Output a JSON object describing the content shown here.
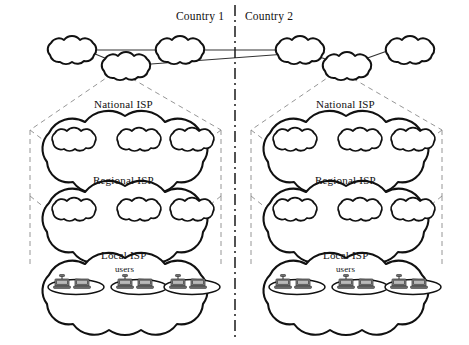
{
  "diagram": {
    "type": "network-topology",
    "countries": [
      {
        "id": "country-1",
        "label": "Country 1"
      },
      {
        "id": "country-2",
        "label": "Country 2"
      }
    ],
    "border": {
      "name": "country-border",
      "style": "dash-dot",
      "x": 235
    },
    "tiers": [
      {
        "id": "backbone",
        "label": "",
        "cloud_count": 3
      },
      {
        "id": "national",
        "label": "National ISP",
        "inner_cloud_count": 3
      },
      {
        "id": "regional",
        "label": "Regional ISP",
        "inner_cloud_count": 3
      },
      {
        "id": "local",
        "label": "Local ISP",
        "inner_cloud_count": 3,
        "users_label": "users",
        "users_per_lan": 2
      }
    ],
    "labels": {
      "country_1": "Country 1",
      "country_2": "Country 2",
      "national_isp": "National ISP",
      "regional_isp": "Regional ISP",
      "local_isp": "Local ISP",
      "users": "users"
    },
    "colors": {
      "cloud_stroke": "#111111",
      "cloud_fill": "#ffffff",
      "solid_link": "#333333",
      "dashed_link": "#8a8a8a",
      "border_line": "#1a1a1a",
      "workstation": "#8d8d8d",
      "background": "#ffffff",
      "text": "#111111"
    }
  }
}
